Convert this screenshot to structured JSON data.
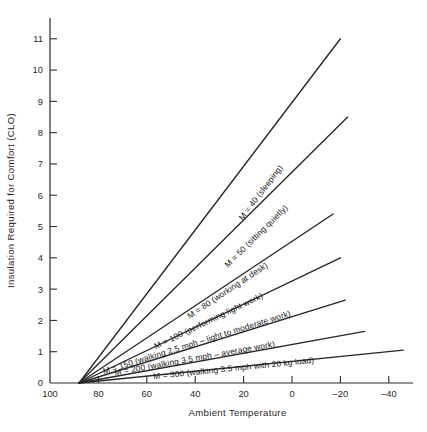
{
  "chart_data": {
    "type": "line",
    "title": "",
    "xlabel": "Ambient Temperature",
    "ylabel": "Insulation Required for Comfort (CLO)",
    "xlim": [
      100,
      -50
    ],
    "ylim": [
      0,
      11.6
    ],
    "x_ticks": [
      100,
      80,
      60,
      40,
      20,
      0,
      -20,
      -40
    ],
    "x_tick_labels": [
      "100",
      "80",
      "60",
      "40",
      "20",
      "0",
      "–20",
      "–40"
    ],
    "y_ticks": [
      0,
      1,
      2,
      3,
      4,
      5,
      6,
      7,
      8,
      9,
      10,
      11
    ],
    "y_tick_labels": [
      "0",
      "1",
      "2",
      "3",
      "4",
      "5",
      "6",
      "7",
      "8",
      "9",
      "10",
      "11"
    ],
    "grid": false,
    "legend_position": "inline-on-lines",
    "x_axis_direction": "decreasing",
    "neutral_temperature_F": 88,
    "series": [
      {
        "name": "M = 40 (sleeping)",
        "label": "M = 40 (sleeping)",
        "metabolic_rate": 40,
        "activity": "sleeping",
        "points": [
          [
            88,
            0
          ],
          [
            -20,
            11.0
          ]
        ],
        "slope_clo_per_degF": -0.1019,
        "label_anchor": [
          12,
          5.95
        ]
      },
      {
        "name": "M = 50 (sitting quietly)",
        "label": "M = 50 (sitting quietly)",
        "metabolic_rate": 50,
        "activity": "sitting quietly",
        "points": [
          [
            88,
            0
          ],
          [
            -23,
            8.5
          ]
        ],
        "slope_clo_per_degF": -0.0766,
        "label_anchor": [
          14,
          4.55
        ]
      },
      {
        "name": "M = 80 (working at desk)",
        "label": "M = 80 (working at desk)",
        "metabolic_rate": 80,
        "activity": "working at desk",
        "points": [
          [
            88,
            0
          ],
          [
            -17,
            5.4
          ]
        ],
        "slope_clo_per_degF": -0.0514,
        "label_anchor": [
          26,
          2.8
        ]
      },
      {
        "name": "M = 100 (performing light work)",
        "label": "M = 100 (performing light work)",
        "metabolic_rate": 100,
        "activity": "performing light work",
        "points": [
          [
            88,
            0
          ],
          [
            -20,
            4.0
          ]
        ],
        "slope_clo_per_degF": -0.037,
        "label_anchor": [
          34,
          1.82
        ]
      },
      {
        "name": "M = 150 (walking 2.5 mph – light to moderate work)",
        "label": "M = 150 (walking 2.5 mph – light to moderate work)",
        "metabolic_rate": 150,
        "activity": "walking 2.5 mph – light to moderate work",
        "points": [
          [
            88,
            0
          ],
          [
            -22,
            2.65
          ]
        ],
        "slope_clo_per_degF": -0.0241,
        "label_anchor": [
          39,
          1.13
        ]
      },
      {
        "name": "M = 200 (walking 3.5 mph – average work)",
        "label": "M = 200 (walking 3.5 mph – average work)",
        "metabolic_rate": 200,
        "activity": "walking 3.5 mph – average work",
        "points": [
          [
            88,
            0
          ],
          [
            -30,
            1.65
          ]
        ],
        "slope_clo_per_degF": -0.014,
        "label_anchor": [
          40,
          0.62
        ]
      },
      {
        "name": "M = 300 (walking 3.5 mph with 20 kg load)",
        "label": "M = 300 (walking 3.5 mph with 20 kg load)",
        "metabolic_rate": 300,
        "activity": "walking 3.5 mph with 20 kg load",
        "points": [
          [
            88,
            0
          ],
          [
            -46,
            1.05
          ]
        ],
        "slope_clo_per_degF": -0.0078,
        "label_anchor": [
          24,
          0.3
        ]
      }
    ]
  }
}
